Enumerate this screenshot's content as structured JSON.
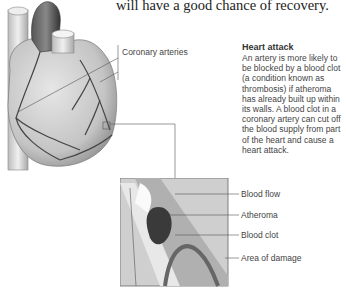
{
  "intro_text": "will have a good chance of recovery.",
  "heart_label": "Coronary arteries",
  "sidebar": {
    "title": "Heart attack",
    "body": "An artery is more likely to be blocked by a blood clot (a condition known as thrombosis) if atheroma has already built up within its walls. A blood clot in a coronary artery can cut off the blood supply from part of the heart and cause a heart attack."
  },
  "diagram_labels": {
    "blood_flow": "Blood flow",
    "atheroma": "Atheroma",
    "blood_clot": "Blood clot",
    "area_of_damage": "Area of damage"
  }
}
